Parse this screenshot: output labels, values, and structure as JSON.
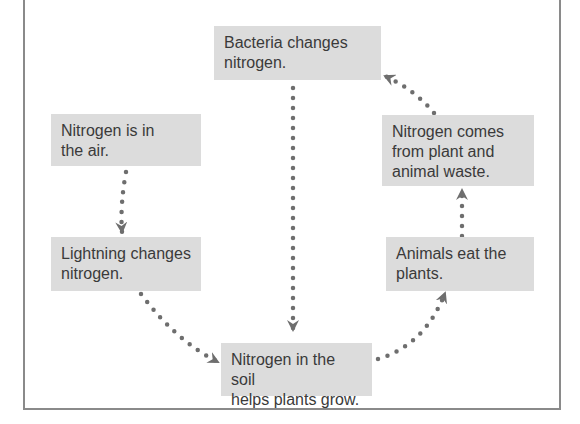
{
  "diagram": {
    "type": "cycle",
    "nodes": [
      {
        "id": "air",
        "label_line1": "Nitrogen is in",
        "label_line2": "the air."
      },
      {
        "id": "lightning",
        "label_line1": "Lightning changes",
        "label_line2": "nitrogen."
      },
      {
        "id": "soil",
        "label_line1": "Nitrogen in the soil",
        "label_line2": "helps plants grow."
      },
      {
        "id": "animals",
        "label_line1": "Animals eat the",
        "label_line2": "plants."
      },
      {
        "id": "waste",
        "label_line1": "Nitrogen comes",
        "label_line2": "from plant and",
        "label_line3": "animal waste."
      },
      {
        "id": "bacteria",
        "label_line1": "Bacteria changes",
        "label_line2": "nitrogen."
      }
    ],
    "edges": [
      {
        "from": "air",
        "to": "lightning"
      },
      {
        "from": "lightning",
        "to": "soil"
      },
      {
        "from": "soil",
        "to": "animals"
      },
      {
        "from": "animals",
        "to": "waste"
      },
      {
        "from": "waste",
        "to": "bacteria"
      },
      {
        "from": "bacteria",
        "to": "soil"
      }
    ],
    "colors": {
      "box_fill": "#dcdcdc",
      "text": "#3a3a3a",
      "arrow": "#6e6e6e",
      "frame": "#8a8a8a"
    }
  }
}
